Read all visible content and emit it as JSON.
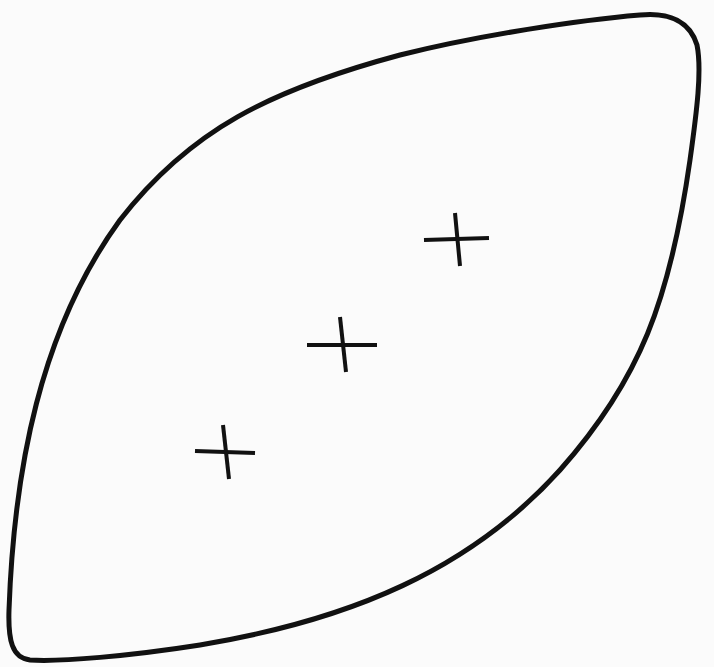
{
  "diagram": {
    "type": "lens-shaped closed outline with three cross marks",
    "stroke_color": "#111111",
    "background_color": "#fbfbfb",
    "outline": {
      "shape": "leaf / lens",
      "corners": [
        {
          "name": "top-right",
          "x": 688,
          "y": 18
        },
        {
          "name": "bottom-left",
          "x": 12,
          "y": 652
        }
      ]
    },
    "marks": [
      {
        "id": "mark-1",
        "symbol": "plus",
        "cx": 226,
        "cy": 452
      },
      {
        "id": "mark-2",
        "symbol": "plus",
        "cx": 343,
        "cy": 345
      },
      {
        "id": "mark-3",
        "symbol": "plus",
        "cx": 457,
        "cy": 238
      }
    ]
  }
}
